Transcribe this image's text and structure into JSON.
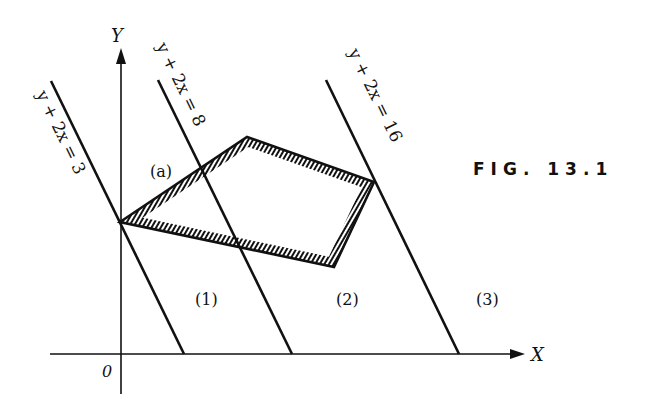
{
  "figure": {
    "caption": "FIG. 13.1",
    "colors": {
      "ink": "#111111",
      "background": "#ffffff"
    }
  },
  "axes": {
    "x_label": "X",
    "y_label": "Y",
    "origin_label": "0"
  },
  "lines": [
    {
      "label": "y + 2x = 3",
      "equation": "y + 2x = 3"
    },
    {
      "label": "y + 2x = 8",
      "equation": "y + 2x = 8"
    },
    {
      "label": "y + 2x = 16",
      "equation": "y + 2x = 16"
    }
  ],
  "regions": [
    {
      "label": "(1)"
    },
    {
      "label": "(2)"
    },
    {
      "label": "(3)"
    }
  ],
  "polygon": {
    "label": "(a)",
    "description": "feasible region (hatched pentagon-like quadrilateral)"
  }
}
